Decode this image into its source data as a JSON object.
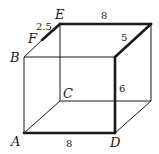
{
  "diagram": {
    "type": "rectangular-prism",
    "vertices": {
      "E": {
        "label": "E",
        "x": 60,
        "y": 24
      },
      "G": {
        "label": "",
        "x": 151,
        "y": 24
      },
      "B": {
        "label": "B",
        "x": 24,
        "y": 57
      },
      "H": {
        "label": "",
        "x": 115,
        "y": 57
      },
      "C": {
        "label": "C",
        "x": 60,
        "y": 101
      },
      "I": {
        "label": "",
        "x": 151,
        "y": 101
      },
      "A": {
        "label": "A",
        "x": 24,
        "y": 133
      },
      "D": {
        "label": "D",
        "x": 115,
        "y": 133
      },
      "F": {
        "label": "F",
        "x": 42,
        "y": 40
      }
    },
    "labels": {
      "A": "A",
      "B": "B",
      "C": "C",
      "D": "D",
      "E": "E",
      "F": "F"
    },
    "measurements": {
      "EF": "2.5",
      "top_edge": "8",
      "top_right_depth": "5",
      "vertical_right": "6",
      "bottom_edge": "8"
    },
    "colors": {
      "line": "#1a1a1a",
      "background": "#ffffff"
    }
  }
}
